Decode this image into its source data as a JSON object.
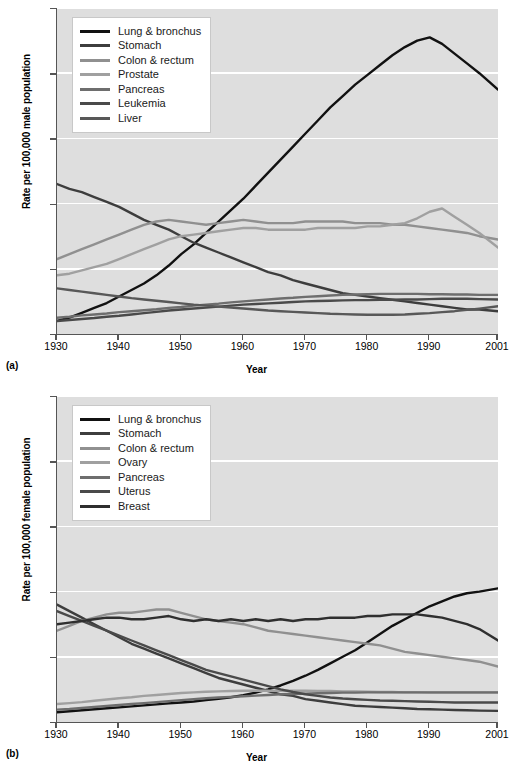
{
  "figure": {
    "panels": [
      {
        "tag": "(a)",
        "ylabel": "Rate per 100,000 male population",
        "xlabel": "Year"
      },
      {
        "tag": "(b)",
        "ylabel": "Rate per 100,000 female population",
        "xlabel": "Year"
      }
    ]
  },
  "chart_data": [
    {
      "type": "line",
      "title": "",
      "xlabel": "Year",
      "ylabel": "Rate per 100,000 male population",
      "xlim": [
        1930,
        2001
      ],
      "ylim": [
        0,
        100
      ],
      "xticks": [
        1930,
        1940,
        1950,
        1960,
        1970,
        1980,
        1990,
        2001
      ],
      "yticks": [
        0,
        20,
        40,
        60,
        80,
        100
      ],
      "grid": "horizontal",
      "legend_position": "top-left",
      "x": [
        1930,
        1932,
        1934,
        1936,
        1938,
        1940,
        1942,
        1944,
        1946,
        1948,
        1950,
        1952,
        1954,
        1956,
        1958,
        1960,
        1962,
        1964,
        1966,
        1968,
        1970,
        1972,
        1974,
        1976,
        1978,
        1980,
        1982,
        1984,
        1986,
        1988,
        1990,
        1992,
        1994,
        1996,
        1998,
        2001
      ],
      "series": [
        {
          "name": "Lung & bronchus",
          "color": "#111111",
          "values": [
            4.0,
            5.0,
            6.5,
            8.0,
            9.5,
            11.5,
            13.5,
            15.5,
            18.0,
            21.0,
            24.5,
            27.5,
            31.0,
            34.5,
            38.0,
            41.5,
            45.5,
            49.5,
            53.5,
            57.5,
            61.5,
            65.5,
            69.5,
            73.0,
            76.5,
            79.5,
            82.5,
            85.5,
            88.0,
            90.0,
            91.0,
            89.0,
            86.0,
            83.0,
            80.0,
            75.0
          ]
        },
        {
          "name": "Stomach",
          "color": "#3d3d3d",
          "values": [
            46.0,
            44.5,
            43.5,
            42.0,
            40.5,
            39.0,
            37.0,
            35.0,
            33.5,
            32.0,
            30.0,
            28.0,
            26.5,
            25.0,
            23.5,
            22.0,
            20.5,
            19.0,
            18.0,
            16.5,
            15.5,
            14.5,
            13.5,
            12.5,
            12.0,
            11.5,
            11.0,
            10.5,
            10.0,
            9.5,
            9.0,
            8.5,
            8.0,
            7.5,
            7.5,
            7.0
          ]
        },
        {
          "name": "Colon & rectum",
          "color": "#909090",
          "values": [
            23.0,
            24.5,
            26.0,
            27.5,
            29.0,
            30.5,
            32.0,
            33.5,
            34.5,
            35.0,
            34.5,
            34.0,
            33.5,
            34.0,
            34.5,
            35.0,
            34.5,
            34.0,
            34.0,
            34.0,
            34.5,
            34.5,
            34.5,
            34.5,
            34.0,
            34.0,
            34.0,
            33.5,
            33.5,
            33.0,
            32.5,
            32.0,
            31.5,
            31.0,
            30.0,
            29.0
          ]
        },
        {
          "name": "Prostate",
          "color": "#a0a0a0",
          "values": [
            18.0,
            18.5,
            19.5,
            20.5,
            21.5,
            23.0,
            24.5,
            26.0,
            27.5,
            29.0,
            30.0,
            30.5,
            31.0,
            31.5,
            32.0,
            32.5,
            32.5,
            32.0,
            32.0,
            32.0,
            32.0,
            32.5,
            32.5,
            32.5,
            32.5,
            33.0,
            33.0,
            33.5,
            34.0,
            35.5,
            37.5,
            38.5,
            36.0,
            33.5,
            31.0,
            26.5
          ]
        },
        {
          "name": "Pancreas",
          "color": "#6e6e6e",
          "values": [
            5.0,
            5.3,
            5.7,
            6.0,
            6.3,
            6.7,
            7.0,
            7.3,
            7.6,
            8.0,
            8.3,
            8.7,
            9.0,
            9.3,
            9.7,
            10.0,
            10.3,
            10.6,
            10.9,
            11.1,
            11.4,
            11.6,
            11.8,
            12.0,
            12.1,
            12.2,
            12.3,
            12.3,
            12.3,
            12.3,
            12.2,
            12.2,
            12.1,
            12.1,
            12.0,
            12.0
          ]
        },
        {
          "name": "Leukemia",
          "color": "#4a4a4a",
          "values": [
            4.0,
            4.3,
            4.6,
            4.9,
            5.3,
            5.6,
            6.0,
            6.4,
            6.8,
            7.2,
            7.5,
            7.8,
            8.1,
            8.4,
            8.7,
            9.0,
            9.2,
            9.4,
            9.6,
            9.8,
            10.0,
            10.1,
            10.2,
            10.3,
            10.4,
            10.4,
            10.5,
            10.5,
            10.6,
            10.6,
            10.7,
            10.8,
            10.8,
            10.8,
            10.7,
            10.6
          ]
        },
        {
          "name": "Liver",
          "color": "#585858",
          "values": [
            14.0,
            13.5,
            13.0,
            12.5,
            12.0,
            11.5,
            11.0,
            10.6,
            10.2,
            9.8,
            9.4,
            9.0,
            8.7,
            8.4,
            8.1,
            7.8,
            7.5,
            7.2,
            7.0,
            6.8,
            6.6,
            6.4,
            6.2,
            6.1,
            6.0,
            5.9,
            5.9,
            5.9,
            6.0,
            6.2,
            6.4,
            6.7,
            7.0,
            7.4,
            7.8,
            8.5
          ]
        }
      ]
    },
    {
      "type": "line",
      "title": "",
      "xlabel": "Year",
      "ylabel": "Rate per 100,000 female population",
      "xlim": [
        1930,
        2001
      ],
      "ylim": [
        0,
        100
      ],
      "xticks": [
        1930,
        1940,
        1950,
        1960,
        1970,
        1980,
        1990,
        2001
      ],
      "yticks": [
        0,
        20,
        40,
        60,
        80,
        100
      ],
      "grid": "horizontal",
      "legend_position": "top-left",
      "x": [
        1930,
        1932,
        1934,
        1936,
        1938,
        1940,
        1942,
        1944,
        1946,
        1948,
        1950,
        1952,
        1954,
        1956,
        1958,
        1960,
        1962,
        1964,
        1966,
        1968,
        1970,
        1972,
        1974,
        1976,
        1978,
        1980,
        1982,
        1984,
        1986,
        1988,
        1990,
        1992,
        1994,
        1996,
        1998,
        2001
      ],
      "series": [
        {
          "name": "Lung & bronchus",
          "color": "#111111",
          "values": [
            3.0,
            3.3,
            3.6,
            3.9,
            4.2,
            4.5,
            4.8,
            5.1,
            5.4,
            5.7,
            6.0,
            6.3,
            6.7,
            7.1,
            7.6,
            8.2,
            9.0,
            10.0,
            11.2,
            12.6,
            14.2,
            16.0,
            18.0,
            20.0,
            22.0,
            24.5,
            27.0,
            29.5,
            31.5,
            33.5,
            35.5,
            37.0,
            38.5,
            39.5,
            40.0,
            41.0
          ]
        },
        {
          "name": "Stomach",
          "color": "#3d3d3d",
          "values": [
            36.0,
            34.0,
            32.0,
            30.0,
            28.0,
            26.0,
            24.0,
            22.5,
            21.0,
            19.5,
            18.0,
            16.5,
            15.0,
            13.5,
            12.5,
            11.5,
            10.5,
            9.5,
            8.5,
            8.0,
            7.0,
            6.5,
            6.0,
            5.5,
            5.0,
            4.8,
            4.6,
            4.4,
            4.2,
            4.0,
            3.9,
            3.8,
            3.7,
            3.6,
            3.5,
            3.4
          ]
        },
        {
          "name": "Colon & rectum",
          "color": "#909090",
          "values": [
            28.0,
            29.5,
            31.0,
            32.0,
            33.0,
            33.5,
            33.5,
            34.0,
            34.5,
            34.5,
            33.5,
            32.5,
            31.5,
            31.0,
            30.5,
            30.0,
            29.0,
            28.0,
            27.5,
            27.0,
            26.5,
            26.0,
            25.5,
            25.0,
            24.5,
            24.0,
            23.5,
            22.5,
            21.5,
            21.0,
            20.5,
            20.0,
            19.5,
            19.0,
            18.5,
            17.0
          ]
        },
        {
          "name": "Ovary",
          "color": "#a0a0a0",
          "values": [
            5.5,
            5.8,
            6.1,
            6.5,
            6.9,
            7.3,
            7.6,
            8.0,
            8.3,
            8.6,
            8.9,
            9.1,
            9.3,
            9.4,
            9.5,
            9.6,
            9.6,
            9.6,
            9.6,
            9.6,
            9.6,
            9.5,
            9.5,
            9.4,
            9.4,
            9.3,
            9.2,
            9.2,
            9.1,
            9.1,
            9.0,
            9.0,
            9.0,
            9.0,
            9.0,
            9.0
          ]
        },
        {
          "name": "Pancreas",
          "color": "#6e6e6e",
          "values": [
            3.8,
            4.0,
            4.3,
            4.6,
            4.9,
            5.2,
            5.5,
            5.8,
            6.1,
            6.4,
            6.7,
            7.0,
            7.3,
            7.5,
            7.7,
            7.9,
            8.1,
            8.3,
            8.5,
            8.6,
            8.7,
            8.8,
            8.9,
            9.0,
            9.0,
            9.1,
            9.1,
            9.1,
            9.1,
            9.1,
            9.1,
            9.1,
            9.1,
            9.1,
            9.1,
            9.1
          ]
        },
        {
          "name": "Uterus",
          "color": "#4a4a4a",
          "values": [
            34.0,
            32.5,
            31.0,
            29.5,
            28.0,
            26.5,
            25.0,
            23.5,
            22.0,
            20.5,
            19.0,
            17.5,
            16.0,
            15.0,
            14.0,
            13.0,
            12.0,
            11.0,
            10.0,
            9.2,
            8.5,
            8.0,
            7.5,
            7.2,
            7.0,
            6.8,
            6.6,
            6.5,
            6.4,
            6.3,
            6.2,
            6.1,
            6.0,
            6.0,
            6.0,
            6.0
          ]
        },
        {
          "name": "Breast",
          "color": "#2f2f2f",
          "values": [
            30.0,
            30.5,
            31.0,
            31.5,
            32.0,
            32.0,
            31.5,
            31.5,
            32.0,
            32.5,
            31.5,
            31.0,
            31.5,
            31.0,
            31.5,
            31.0,
            31.5,
            31.0,
            31.5,
            31.0,
            31.5,
            31.5,
            32.0,
            32.0,
            32.0,
            32.5,
            32.5,
            33.0,
            33.0,
            33.0,
            32.5,
            32.0,
            31.0,
            30.0,
            28.5,
            25.0
          ]
        }
      ]
    }
  ]
}
